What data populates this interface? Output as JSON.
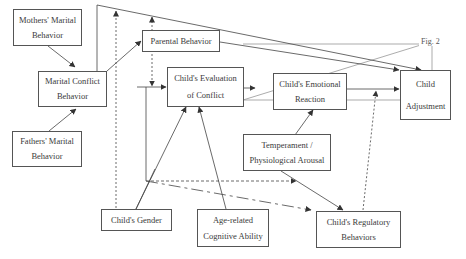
{
  "figure_label": "Fig. 2",
  "nodes": {
    "mothers": {
      "line1": "Mothers' Marital",
      "line2": "Behavior"
    },
    "fathers": {
      "line1": "Fathers' Marital",
      "line2": "Behavior"
    },
    "marital_conflict": {
      "line1": "Marital Conflict",
      "line2": "Behavior"
    },
    "parental": {
      "line1": "Parental Behavior"
    },
    "evaluation": {
      "line1": "Child's Evaluation",
      "line2": "of Conflict"
    },
    "emotional": {
      "line1": "Child's Emotional",
      "line2": "Reaction"
    },
    "adjustment": {
      "line1": "Child",
      "line2": "Adjustment"
    },
    "temperament": {
      "line1": "Temperament /",
      "line2": "Physiological Arousal"
    },
    "gender": {
      "line1": "Child's Gender"
    },
    "age": {
      "line1": "Age-related",
      "line2": "Cognitive Ability"
    },
    "regulatory": {
      "line1": "Child's Regulatory",
      "line2": "Behaviors"
    }
  },
  "edges": [
    {
      "from": "Mothers' Marital Behavior",
      "to": "Marital Conflict Behavior",
      "style": "solid"
    },
    {
      "from": "Fathers' Marital Behavior",
      "to": "Marital Conflict Behavior",
      "style": "solid"
    },
    {
      "from": "Marital Conflict Behavior",
      "to": "Parental Behavior",
      "style": "solid"
    },
    {
      "from": "Marital Conflict Behavior",
      "to": "Child's Evaluation of Conflict",
      "style": "solid"
    },
    {
      "from": "Marital Conflict Behavior",
      "to": "Child Adjustment",
      "style": "solid"
    },
    {
      "from": "Parental Behavior",
      "to": "Child Adjustment",
      "style": "solid"
    },
    {
      "from": "Child's Evaluation of Conflict",
      "to": "Child's Emotional Reaction",
      "style": "solid"
    },
    {
      "from": "Child's Emotional Reaction",
      "to": "Child Adjustment",
      "style": "solid"
    },
    {
      "from": "Temperament / Physiological Arousal",
      "to": "Child's Emotional Reaction",
      "style": "solid"
    },
    {
      "from": "Temperament / Physiological Arousal",
      "to": "Child's Regulatory Behaviors",
      "style": "solid"
    },
    {
      "from": "Child's Gender",
      "to": "Child's Evaluation of Conflict",
      "style": "solid"
    },
    {
      "from": "Age-related Cognitive Ability",
      "to": "Child's Evaluation of Conflict",
      "style": "solid"
    },
    {
      "from": "Child's Gender",
      "to": "Marital–Adjustment path",
      "style": "dashed"
    },
    {
      "from": "Child's Regulatory Behaviors",
      "to": "Emotional Reaction–Adjustment path",
      "style": "dashed"
    },
    {
      "from": "Parental Behavior",
      "to": "Marital Conflict–Evaluation path",
      "style": "dashed"
    },
    {
      "from": "Marital Conflict Behavior",
      "to": "Child's Regulatory Behaviors",
      "style": "long-dash"
    },
    {
      "from": "Marital Conflict Behavior",
      "to": "Temperament / Physiological Arousal",
      "style": "dashed"
    }
  ]
}
